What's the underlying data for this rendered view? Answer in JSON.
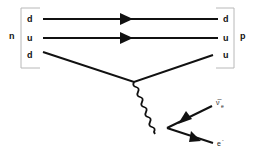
{
  "diagram": {
    "type": "feynman-diagram",
    "left_particle": {
      "label": "n",
      "quarks": [
        "d",
        "u",
        "d"
      ]
    },
    "right_particle": {
      "label": "p",
      "quarks": [
        "d",
        "u",
        "u"
      ]
    },
    "boson": {
      "name": "W-",
      "style": "wavy"
    },
    "leptons": [
      {
        "label": "ν̅",
        "subscript": "e",
        "name": "electron-antineutrino"
      },
      {
        "label": "e",
        "superscript": "-",
        "name": "electron"
      }
    ],
    "colors": {
      "line": "#111111",
      "bracket": "#b8b8b8",
      "background": "#ffffff"
    }
  }
}
